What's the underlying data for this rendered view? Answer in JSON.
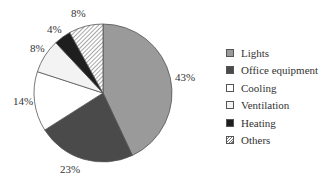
{
  "chart_data": {
    "type": "pie",
    "title": "",
    "categories": [
      "Lights",
      "Office equipment",
      "Cooling",
      "Ventilation",
      "Heating",
      "Others"
    ],
    "values": [
      43,
      23,
      14,
      8,
      4,
      8
    ],
    "labels": [
      "43%",
      "23%",
      "14%",
      "8%",
      "4%",
      "8%"
    ],
    "colors": [
      "#9a9a9a",
      "#4a4a4a",
      "#ffffff",
      "#f3f3f3",
      "#1e1e1e",
      "hatch"
    ],
    "start_angle": "12 o'clock",
    "direction": "clockwise",
    "legend_position": "right"
  },
  "legend": {
    "items": [
      {
        "label": "Lights",
        "color": "#9a9a9a"
      },
      {
        "label": "Office equipment",
        "color": "#4a4a4a"
      },
      {
        "label": "Cooling",
        "color": "#ffffff"
      },
      {
        "label": "Ventilation",
        "color": "#f3f3f3"
      },
      {
        "label": "Heating",
        "color": "#1e1e1e"
      },
      {
        "label": "Others",
        "color": "hatch"
      }
    ]
  },
  "slice_labels": {
    "lights": "43%",
    "office": "23%",
    "cooling": "14%",
    "ventilation": "8%",
    "heating": "4%",
    "others": "8%"
  }
}
